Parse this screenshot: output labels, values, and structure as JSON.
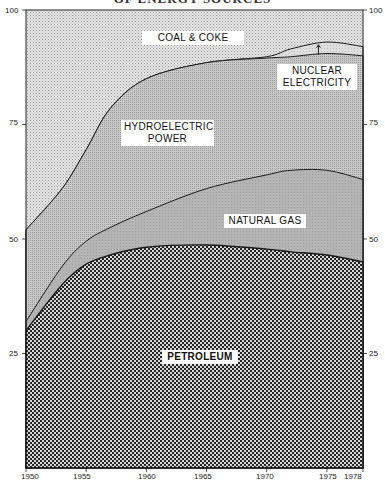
{
  "title": "OF ENERGY SOURCES",
  "chart_data": {
    "type": "area",
    "stacked": true,
    "title": "OF ENERGY SOURCES",
    "xlabel": "",
    "ylabel": "Percent",
    "xlim": [
      1950,
      1978
    ],
    "ylim": [
      0,
      100
    ],
    "x_ticks": [
      "1950",
      "1955",
      "1960",
      "1965",
      "1970",
      "1975",
      "1978"
    ],
    "y_ticks_left": [
      "100",
      "75",
      "50",
      "25"
    ],
    "y_ticks_right": [
      "100",
      "75",
      "50",
      "25"
    ],
    "x": [
      1950,
      1953,
      1955,
      1957,
      1960,
      1965,
      1970,
      1972,
      1975,
      1978
    ],
    "cumulative_series": [
      {
        "name": "PETROLEUM",
        "top": [
          30,
          40,
          44.5,
          46.5,
          48.2,
          48.7,
          47.8,
          47.2,
          46.5,
          45
        ]
      },
      {
        "name": "NATURAL GAS",
        "top": [
          32,
          44,
          49.5,
          52.5,
          56,
          61,
          64,
          65,
          65,
          63
        ]
      },
      {
        "name": "HYDROELECTRIC POWER",
        "top": [
          52,
          61,
          69.5,
          78.5,
          85,
          88.5,
          89.5,
          89.8,
          90.5,
          90
        ]
      },
      {
        "name": "NUCLEAR ELECTRICITY",
        "top": [
          52,
          61,
          69.5,
          78.5,
          85,
          88.5,
          89.8,
          91.5,
          93,
          92
        ]
      },
      {
        "name": "COAL & COKE",
        "top": [
          100,
          100,
          100,
          100,
          100,
          100,
          100,
          100,
          100,
          100
        ]
      }
    ],
    "series": [
      {
        "name": "PETROLEUM",
        "values": [
          30,
          40,
          44.5,
          46.5,
          48.2,
          48.7,
          47.8,
          47.2,
          46.5,
          45
        ]
      },
      {
        "name": "NATURAL GAS",
        "values": [
          2,
          4,
          5,
          6,
          7.8,
          12.3,
          16.2,
          17.8,
          18.5,
          18
        ]
      },
      {
        "name": "HYDROELECTRIC POWER",
        "values": [
          20,
          17,
          20,
          26,
          29,
          27.5,
          25.5,
          24.8,
          25.5,
          27
        ]
      },
      {
        "name": "NUCLEAR ELECTRICITY",
        "values": [
          0,
          0,
          0,
          0,
          0,
          0,
          0.3,
          1.7,
          2.5,
          2
        ]
      },
      {
        "name": "COAL & COKE",
        "values": [
          48,
          39,
          30.5,
          21.5,
          15,
          11.5,
          10.2,
          8.5,
          7,
          8
        ]
      }
    ],
    "annotations": [
      "COAL & COKE",
      "NUCLEAR ELECTRICITY",
      "HYDROELECTRIC POWER",
      "NATURAL GAS",
      "PETROLEUM"
    ],
    "grid": false,
    "legend": "inline labels"
  },
  "labels": {
    "coal": "COAL & COKE",
    "nuclear_1": "NUCLEAR",
    "nuclear_2": "ELECTRICITY",
    "hydro_1": "HYDROELECTRIC",
    "hydro_2": "POWER",
    "gas": "NATURAL GAS",
    "petroleum": "PETROLEUM"
  },
  "axis": {
    "left": [
      "100",
      "75",
      "50",
      "25"
    ],
    "right": [
      "100",
      "75",
      "50",
      "25"
    ],
    "x": [
      "1950",
      "1955",
      "1960",
      "1965",
      "1970",
      "1975",
      "1978"
    ]
  }
}
